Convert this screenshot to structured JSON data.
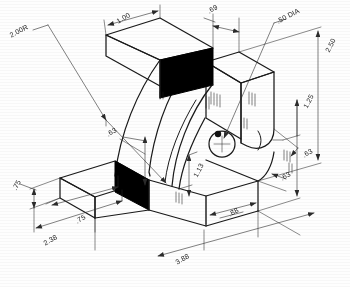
{
  "drawing": {
    "title": "Isometric pictorial of curved bracket",
    "type": "isometric-engineering-sketch",
    "line_color": "#1a1a1a",
    "fill_color_section": "#000000",
    "paper_color": "#fefefe",
    "dimensions": [
      {
        "id": "radius-outer",
        "label": "2.00R",
        "x": 10,
        "y": 32,
        "rot": -28
      },
      {
        "id": "top-width",
        "label": "1.00",
        "x": 117,
        "y": 18,
        "rot": -30
      },
      {
        "id": "top-depth",
        "label": ".69",
        "x": 208,
        "y": 8,
        "rot": -30
      },
      {
        "id": "hole-diameter",
        "label": ".50 DIA",
        "x": 277,
        "y": 18,
        "rot": -28
      },
      {
        "id": "overall-height",
        "label": "2.50",
        "x": 327,
        "y": 48,
        "rot": -62
      },
      {
        "id": "hole-height",
        "label": "1.25",
        "x": 305,
        "y": 104,
        "rot": -62
      },
      {
        "id": "right-thickness",
        "label": ".63",
        "x": 303,
        "y": 152,
        "rot": -30
      },
      {
        "id": "base-thickness",
        "label": ".63",
        "x": 281,
        "y": 175,
        "rot": -30
      },
      {
        "id": "arm-thickness",
        "label": ".63",
        "x": 107,
        "y": 131,
        "rot": -30
      },
      {
        "id": "left-web",
        "label": ".75",
        "x": 14,
        "y": 186,
        "rot": -62
      },
      {
        "id": "front-depth",
        "label": ".75",
        "x": 76,
        "y": 218,
        "rot": -30
      },
      {
        "id": "left-overall",
        "label": "2.38",
        "x": 44,
        "y": 240,
        "rot": -30
      },
      {
        "id": "rise-height",
        "label": "1.13",
        "x": 195,
        "y": 173,
        "rot": -62
      },
      {
        "id": "hole-offset",
        "label": ".88",
        "x": 229,
        "y": 211,
        "rot": -30
      },
      {
        "id": "overall-length",
        "label": "3.88",
        "x": 176,
        "y": 259,
        "rot": -30
      }
    ],
    "features": [
      {
        "name": "sectioned-end-face-upper",
        "style": "solid-black"
      },
      {
        "name": "sectioned-end-face-lower",
        "style": "solid-black"
      },
      {
        "name": "through-hole",
        "style": "circle-with-centermark"
      },
      {
        "name": "curved-inner-arc",
        "style": "outline"
      },
      {
        "name": "curved-outer-arc",
        "style": "outline"
      },
      {
        "name": "shading-hatch-marks",
        "style": "short-parallel-strokes"
      }
    ]
  }
}
